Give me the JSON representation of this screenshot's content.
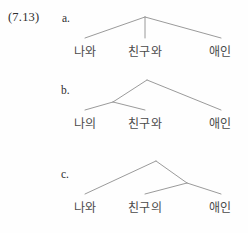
{
  "example": {
    "number": "(7.13)"
  },
  "items": [
    {
      "label": "a.",
      "structure": "flat-ternary",
      "leaves": [
        "나와",
        "친구와",
        "애인"
      ]
    },
    {
      "label": "b.",
      "structure": "left-branching",
      "leaves": [
        "나의",
        "친구와",
        "애인"
      ]
    },
    {
      "label": "c.",
      "structure": "right-branching",
      "leaves": [
        "나와",
        "친구의",
        "애인"
      ]
    }
  ],
  "colors": {
    "background": "#fefefe",
    "text": "#3a3a3a",
    "leaf_text": "#4a4a4a",
    "branch_line": "#8e8e8e"
  }
}
